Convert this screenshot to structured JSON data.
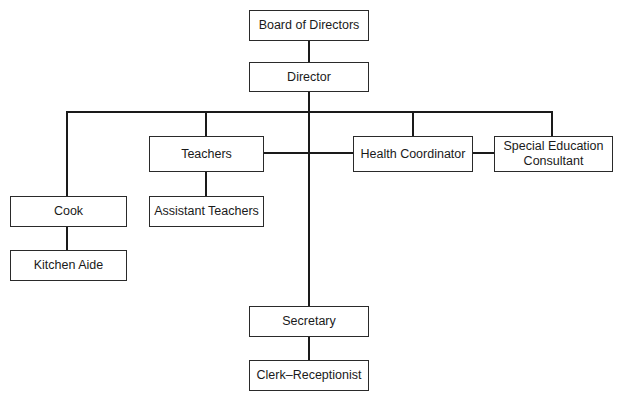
{
  "diagram": {
    "type": "organizational-chart",
    "nodes": {
      "board": "Board of Directors",
      "director": "Director",
      "cook": "Cook",
      "kitchen_aide": "Kitchen Aide",
      "teachers": "Teachers",
      "assistant_teachers": "Assistant Teachers",
      "health_coordinator": "Health Coordinator",
      "special_ed_line1": "Special Education",
      "special_ed_line2": "Consultant",
      "secretary": "Secretary",
      "clerk": "Clerk–Receptionist"
    },
    "edges": [
      [
        "Board of Directors",
        "Director"
      ],
      [
        "Director",
        "Cook"
      ],
      [
        "Director",
        "Teachers"
      ],
      [
        "Director",
        "Health Coordinator"
      ],
      [
        "Director",
        "Special Education Consultant"
      ],
      [
        "Director",
        "Secretary"
      ],
      [
        "Cook",
        "Kitchen Aide"
      ],
      [
        "Teachers",
        "Assistant Teachers"
      ],
      [
        "Teachers",
        "Health Coordinator"
      ],
      [
        "Health Coordinator",
        "Special Education Consultant"
      ],
      [
        "Secretary",
        "Clerk–Receptionist"
      ]
    ]
  }
}
